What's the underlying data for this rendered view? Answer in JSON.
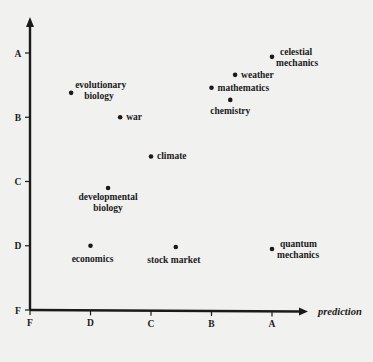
{
  "chart_data": {
    "type": "scatter",
    "title": "",
    "xlabel": "prediction",
    "ylabel": "",
    "x_ticks": [
      "F",
      "D",
      "C",
      "B",
      "A"
    ],
    "y_ticks": [
      "F",
      "D",
      "C",
      "B",
      "A"
    ],
    "scale_note": "Grade scale mapped F=0, D=1, C=2, B=3, A=4",
    "xlim": [
      0,
      4.5
    ],
    "ylim": [
      0,
      4.5
    ],
    "grid": false,
    "legend": null,
    "points": [
      {
        "label": "celestial mechanics",
        "lines": [
          "celestial",
          "mechanics"
        ],
        "x": 4.0,
        "y": 3.94
      },
      {
        "label": "weather",
        "lines": [
          "weather"
        ],
        "x": 3.39,
        "y": 3.66
      },
      {
        "label": "mathematics",
        "lines": [
          "mathematics"
        ],
        "x": 3.0,
        "y": 3.46
      },
      {
        "label": "chemistry",
        "lines": [
          "chemistry"
        ],
        "x": 3.31,
        "y": 3.27
      },
      {
        "label": "evolutionary biology",
        "lines": [
          "evolutionary",
          "biology"
        ],
        "x": 0.68,
        "y": 3.38
      },
      {
        "label": "war",
        "lines": [
          "war"
        ],
        "x": 1.49,
        "y": 3.0
      },
      {
        "label": "climate",
        "lines": [
          "climate"
        ],
        "x": 2.0,
        "y": 2.39
      },
      {
        "label": "developmental biology",
        "lines": [
          "developmental",
          "biology"
        ],
        "x": 1.29,
        "y": 1.9
      },
      {
        "label": "economics",
        "lines": [
          "economics"
        ],
        "x": 1.0,
        "y": 1.0
      },
      {
        "label": "stock market",
        "lines": [
          "stock market"
        ],
        "x": 2.41,
        "y": 0.98
      },
      {
        "label": "quantum mechanics",
        "lines": [
          "quantum",
          "mechanics"
        ],
        "x": 4.0,
        "y": 0.95
      }
    ]
  },
  "colors": {
    "background": "#f1f1ef",
    "ink": "#1a1a1a"
  }
}
